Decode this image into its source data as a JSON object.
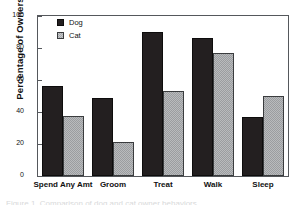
{
  "chart_data": {
    "type": "bar",
    "title": "",
    "xlabel": "",
    "ylabel": "Percentage of Owners",
    "categories": [
      "Spend Any Amt",
      "Groom",
      "Treat",
      "Walk",
      "Sleep"
    ],
    "series": [
      {
        "name": "Dog",
        "values": [
          56,
          49,
          90,
          86,
          37
        ],
        "color": "#231f20",
        "fill": "solid-dark"
      },
      {
        "name": "Cat",
        "values": [
          37.5,
          21,
          53,
          77,
          50
        ],
        "color": "#b9bbbd",
        "fill": "light-gray-stipple"
      }
    ],
    "ylim": [
      0,
      100
    ],
    "yticks": [
      0,
      20,
      40,
      60,
      80,
      100
    ],
    "ytick_labels": [
      "0",
      "20",
      "40",
      "60",
      "80",
      "100"
    ],
    "grid": false,
    "legend_position": "upper-left-inside",
    "frame": true
  },
  "legend": {
    "entries": [
      {
        "label": "Dog",
        "swatch": "dog-swatch"
      },
      {
        "label": "Cat",
        "swatch": "cat-swatch"
      }
    ]
  },
  "caption": {
    "text": "Figure 1. Comparison of dog and cat owner behaviors."
  }
}
